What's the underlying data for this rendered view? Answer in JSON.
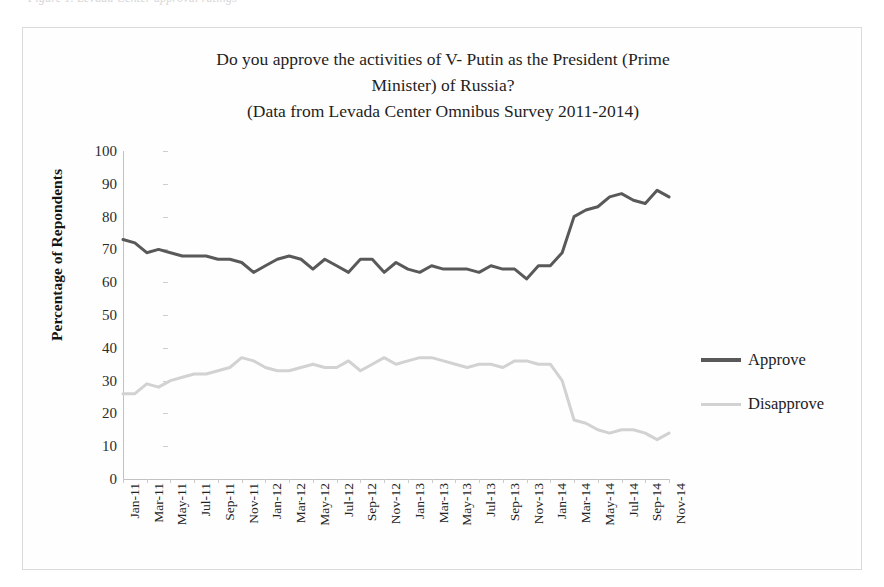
{
  "page": {
    "top_caption": "Figure 1. Levada Center approval ratings",
    "frame_border_color": "#dadada",
    "background": "#ffffff"
  },
  "chart_data": {
    "type": "line",
    "title": "Do you approve the activities of V- Putin as the President (Prime Minister) of Russia? (Data from Levada Center Omnibus Survey 2011-2014)",
    "title_lines": [
      "Do you approve the activities of V- Putin as the President (Prime",
      "Minister) of Russia?",
      "(Data from Levada Center Omnibus Survey 2011-2014)"
    ],
    "xlabel": "",
    "ylabel": "Percentage of Repondents",
    "ylim": [
      0,
      100
    ],
    "ytick_step": 10,
    "yticks": [
      0,
      10,
      20,
      30,
      40,
      50,
      60,
      70,
      80,
      90,
      100
    ],
    "grid": false,
    "legend_position": "right",
    "colors": {
      "approve": "#595959",
      "disapprove": "#d2d2d2",
      "axis": "#c2c2c2",
      "text": "#1f1f1f"
    },
    "x": [
      "Jan-11",
      "Feb-11",
      "Mar-11",
      "Apr-11",
      "May-11",
      "Jun-11",
      "Jul-11",
      "Aug-11",
      "Sep-11",
      "Oct-11",
      "Nov-11",
      "Dec-11",
      "Jan-12",
      "Feb-12",
      "Mar-12",
      "Apr-12",
      "May-12",
      "Jun-12",
      "Jul-12",
      "Aug-12",
      "Sep-12",
      "Oct-12",
      "Nov-12",
      "Dec-12",
      "Jan-13",
      "Feb-13",
      "Mar-13",
      "Apr-13",
      "May-13",
      "Jun-13",
      "Jul-13",
      "Aug-13",
      "Sep-13",
      "Oct-13",
      "Nov-13",
      "Dec-13",
      "Jan-14",
      "Feb-14",
      "Mar-14",
      "Apr-14",
      "May-14",
      "Jun-14",
      "Jul-14",
      "Aug-14",
      "Sep-14",
      "Oct-14",
      "Nov-14"
    ],
    "xtick_labels": [
      "Jan-11",
      "Mar-11",
      "May-11",
      "Jul-11",
      "Sep-11",
      "Nov-11",
      "Jan-12",
      "Mar-12",
      "May-12",
      "Jul-12",
      "Sep-12",
      "Nov-12",
      "Jan-13",
      "Mar-13",
      "May-13",
      "Jul-13",
      "Sep-13",
      "Nov-13",
      "Jan-14",
      "Mar-14",
      "May-14",
      "Jul-14",
      "Sep-14",
      "Nov-14"
    ],
    "series": [
      {
        "name": "Approve",
        "color": "#595959",
        "width": 3,
        "values": [
          73,
          72,
          69,
          70,
          69,
          68,
          68,
          68,
          67,
          67,
          66,
          63,
          65,
          67,
          68,
          67,
          64,
          67,
          65,
          63,
          67,
          67,
          63,
          66,
          64,
          63,
          65,
          64,
          64,
          64,
          63,
          65,
          64,
          64,
          61,
          65,
          65,
          69,
          80,
          82,
          83,
          86,
          87,
          85,
          84,
          88,
          86
        ]
      },
      {
        "name": "Disapprove",
        "color": "#d2d2d2",
        "width": 3,
        "values": [
          26,
          26,
          29,
          28,
          30,
          31,
          32,
          32,
          33,
          34,
          37,
          36,
          34,
          33,
          33,
          34,
          35,
          34,
          34,
          36,
          33,
          35,
          37,
          35,
          36,
          37,
          37,
          36,
          35,
          34,
          35,
          35,
          34,
          36,
          36,
          35,
          35,
          30,
          18,
          17,
          15,
          14,
          15,
          15,
          14,
          12,
          14
        ]
      }
    ],
    "annotations": []
  },
  "legend": {
    "items": [
      {
        "label": "Approve",
        "color": "#595959",
        "thickness": 4
      },
      {
        "label": "Disapprove",
        "color": "#d2d2d2",
        "thickness": 3
      }
    ]
  }
}
